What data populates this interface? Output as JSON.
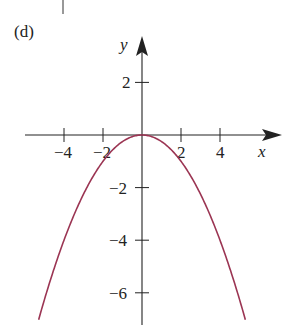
{
  "panel_label": "(d)",
  "colors": {
    "axis": "#222222",
    "curve": "#9b3553",
    "text": "#222222"
  },
  "chart_data": {
    "type": "line",
    "title": "",
    "xlabel": "x",
    "ylabel": "y",
    "equation": "y = -x^2/4",
    "x_ticks": [
      -4,
      -2,
      2,
      4
    ],
    "x_tick_labels": [
      "−4",
      "−2",
      "2",
      "4"
    ],
    "y_ticks": [
      2,
      -2,
      -4,
      -6
    ],
    "y_tick_labels": [
      "2",
      "−2",
      "−4",
      "−6"
    ],
    "xlim": [
      -7,
      7
    ],
    "ylim": [
      -7,
      3.5
    ],
    "grid": false,
    "legend": null,
    "series": [
      {
        "name": "parabola",
        "x": [
          -5.3,
          -5,
          -4,
          -3,
          -2,
          -1,
          0,
          1,
          2,
          3,
          4,
          5,
          5.3
        ],
        "y": [
          -7.02,
          -6.25,
          -4,
          -2.25,
          -1,
          -0.25,
          0,
          -0.25,
          -1,
          -2.25,
          -4,
          -6.25,
          -7.02
        ]
      }
    ]
  }
}
